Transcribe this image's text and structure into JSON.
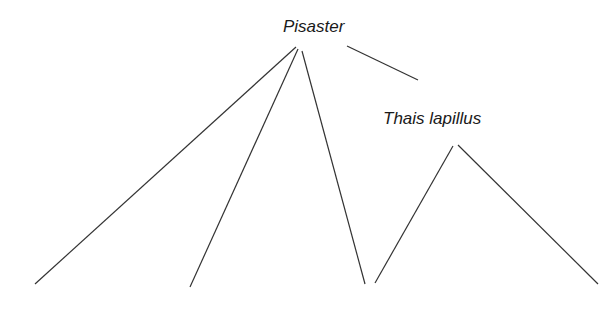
{
  "diagram": {
    "type": "food-web",
    "nodes": [
      {
        "id": "pisaster",
        "label": "Pisaster",
        "x": 283,
        "y": 17
      },
      {
        "id": "thais",
        "label": "Thais lapillus",
        "x": 383,
        "y": 109
      }
    ],
    "edges": [
      {
        "from": "pisaster",
        "x1": 296,
        "y1": 47,
        "x2": 35,
        "y2": 284
      },
      {
        "from": "pisaster",
        "x1": 298,
        "y1": 49,
        "x2": 190,
        "y2": 287
      },
      {
        "from": "pisaster",
        "x1": 302,
        "y1": 51,
        "x2": 365,
        "y2": 284
      },
      {
        "from": "pisaster",
        "to": "thais",
        "x1": 347,
        "y1": 46,
        "x2": 418,
        "y2": 80
      },
      {
        "from": "thais",
        "x1": 453,
        "y1": 146,
        "x2": 375,
        "y2": 283
      },
      {
        "from": "thais",
        "x1": 458,
        "y1": 145,
        "x2": 598,
        "y2": 284
      }
    ],
    "line_color": "#333333"
  }
}
